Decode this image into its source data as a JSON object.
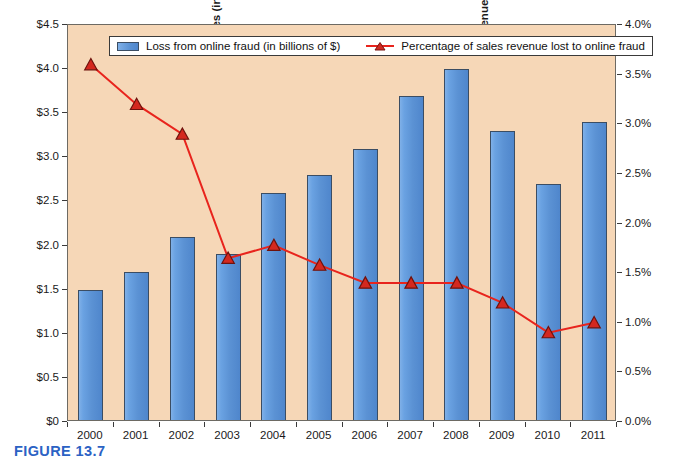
{
  "figure": {
    "caption": "FIGURE 13.7"
  },
  "chart_data": {
    "type": "bar",
    "title": "",
    "subtitle": "",
    "categories": [
      "2000",
      "2001",
      "2002",
      "2003",
      "2004",
      "2005",
      "2006",
      "2007",
      "2008",
      "2009",
      "2010",
      "2011"
    ],
    "xlabel": "",
    "grid": false,
    "legend_position": "top-inside",
    "plot_background": "#f6d7b7",
    "series": [
      {
        "name": "Loss from online fraud (in billions of $)",
        "type": "bar",
        "axis": "left",
        "color": "#5b92d4",
        "border_color": "#3b4d63",
        "values": [
          1.5,
          1.7,
          2.1,
          1.9,
          2.6,
          2.8,
          3.1,
          3.7,
          4.0,
          3.3,
          2.7,
          3.4
        ]
      },
      {
        "name": "Percentage of sales revenue lost to online fraud",
        "type": "line",
        "axis": "right",
        "color": "#e8241d",
        "marker": "triangle",
        "values": [
          3.6,
          3.2,
          2.9,
          1.65,
          1.78,
          1.58,
          1.4,
          1.4,
          1.4,
          1.2,
          0.9,
          1.0
        ]
      }
    ],
    "left_axis": {
      "label": "Online fraud losses (in billions of $)",
      "ylim": [
        0,
        4.5
      ],
      "ticks": [
        0,
        0.5,
        1.0,
        1.5,
        2.0,
        2.5,
        3.0,
        3.5,
        4.0,
        4.5
      ],
      "tick_labels": [
        "$0",
        "$0.5",
        "$1.0",
        "$1.5",
        "$2.0",
        "$2.5",
        "$3.0",
        "$3.5",
        "$4.0",
        "$4.5"
      ]
    },
    "right_axis": {
      "label": "Percentage of sales revenue lost to online fraud",
      "ylim": [
        0,
        4.0
      ],
      "ticks": [
        0,
        0.5,
        1.0,
        1.5,
        2.0,
        2.5,
        3.0,
        3.5,
        4.0
      ],
      "tick_labels": [
        "0.0%",
        "0.5%",
        "1.0%",
        "1.5%",
        "2.0%",
        "2.5%",
        "3.0%",
        "3.5%",
        "4.0%"
      ]
    },
    "legend": [
      "Loss from online fraud (in billions of $)",
      "Percentage of sales revenue lost to online fraud"
    ]
  }
}
